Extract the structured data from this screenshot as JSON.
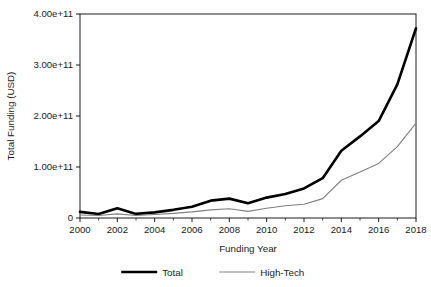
{
  "chart_data": {
    "type": "line",
    "title": "",
    "xlabel": "Funding Year",
    "ylabel": "Total Funding (USD)",
    "xlim": [
      2000,
      2018
    ],
    "ylim": [
      0,
      400000000000
    ],
    "grid": false,
    "legend_position": "bottom-center",
    "x": [
      2000,
      2001,
      2002,
      2003,
      2004,
      2005,
      2006,
      2007,
      2008,
      2009,
      2010,
      2011,
      2012,
      2013,
      2014,
      2015,
      2016,
      2017,
      2018
    ],
    "xticks": [
      2000,
      2002,
      2004,
      2006,
      2008,
      2010,
      2012,
      2014,
      2016,
      2018
    ],
    "xtick_labels": [
      "2000",
      "2002",
      "2004",
      "2006",
      "2008",
      "2010",
      "2012",
      "2014",
      "2016",
      "2018"
    ],
    "yticks": [
      0,
      100000000000,
      200000000000,
      300000000000,
      400000000000
    ],
    "ytick_labels": [
      "0",
      "1.00e+11",
      "2.00e+11",
      "3.00e+11",
      "4.00e+11"
    ],
    "series": [
      {
        "name": "Total",
        "color": "#000000",
        "line_width": 2.6,
        "values": [
          12000000000,
          8000000000,
          19000000000,
          8000000000,
          11000000000,
          16000000000,
          22000000000,
          34000000000,
          38000000000,
          29000000000,
          40000000000,
          47000000000,
          58000000000,
          78000000000,
          132000000000,
          160000000000,
          190000000000,
          262000000000,
          372000000000
        ]
      },
      {
        "name": "High-Tech",
        "color": "#808080",
        "line_width": 1.1,
        "values": [
          6000000000,
          5000000000,
          8000000000,
          5000000000,
          7000000000,
          9000000000,
          12000000000,
          16000000000,
          18000000000,
          13000000000,
          19000000000,
          24000000000,
          27000000000,
          38000000000,
          74000000000,
          90000000000,
          107000000000,
          140000000000,
          186000000000
        ]
      }
    ]
  },
  "legend": {
    "items": [
      {
        "label": "Total",
        "swatch": "thick-black-line"
      },
      {
        "label": "High-Tech",
        "swatch": "thin-gray-line"
      }
    ]
  },
  "axes": {
    "x_title": "Funding Year",
    "y_title": "Total Funding (USD)"
  },
  "colors": {
    "total_series": "#000000",
    "hightech_series": "#808080",
    "axis": "#1a1a1a",
    "background": "#ffffff"
  },
  "cropped_title": "clipped-title-text"
}
